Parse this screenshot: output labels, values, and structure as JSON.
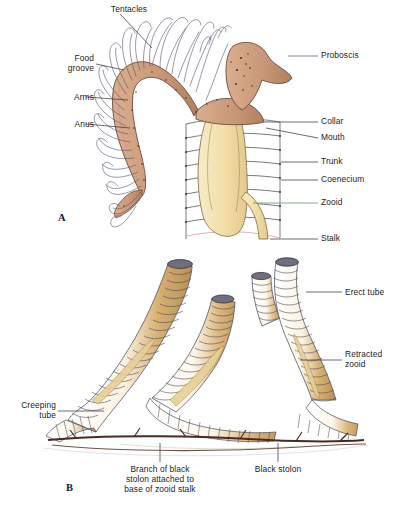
{
  "figure": {
    "type": "biological-diagram",
    "background_color": "#ffffff",
    "label_color": "#232328",
    "palette": {
      "proboscis_collar_tan": "#c89878",
      "zooid_body_cream": "#f5e2b0",
      "tube_ochre": "#c8a060",
      "tube_outline": "#4b4b63",
      "stolon_dark": "#4a2a22",
      "tentacle_line": "#5a5a72",
      "leader_line": "#3a3a44"
    }
  },
  "panels": [
    {
      "id": "A",
      "letter": "A",
      "caption": "",
      "labels_left": [
        {
          "name": "tentacles",
          "text": "Tentacles"
        },
        {
          "name": "food-groove",
          "text": "Food\ngroove"
        },
        {
          "name": "arms",
          "text": "Arms"
        },
        {
          "name": "anus",
          "text": "Anus"
        }
      ],
      "labels_right": [
        {
          "name": "proboscis",
          "text": "Proboscis"
        },
        {
          "name": "collar",
          "text": "Collar"
        },
        {
          "name": "mouth",
          "text": "Mouth"
        },
        {
          "name": "trunk",
          "text": "Trunk"
        },
        {
          "name": "coenecium",
          "text": "Coenecium"
        },
        {
          "name": "zooid",
          "text": "Zooid"
        },
        {
          "name": "stalk",
          "text": "Stalk"
        }
      ]
    },
    {
      "id": "B",
      "letter": "B",
      "labels_left": [
        {
          "name": "creeping-tube",
          "text": "Creeping\ntube"
        }
      ],
      "labels_right": [
        {
          "name": "erect-tube",
          "text": "Erect tube"
        },
        {
          "name": "retracted-zooid",
          "text": "Retracted\nzooid"
        }
      ],
      "labels_bottom": [
        {
          "name": "branch-of-black-stolon",
          "text": "Branch of black\nstolon attached to\nbase of zooid stalk"
        },
        {
          "name": "black-stolon",
          "text": "Black stolon"
        }
      ]
    }
  ]
}
